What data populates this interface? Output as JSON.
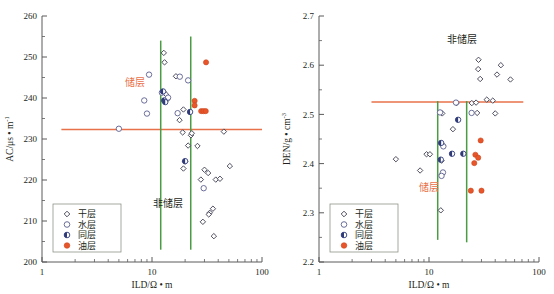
{
  "figure": {
    "panels": [
      "left",
      "right"
    ]
  },
  "chart_data": [
    {
      "panel": "left",
      "type": "scatter",
      "title": "",
      "xlabel": "ILD/Ω • m",
      "ylabel": "AC/μs • m",
      "ylabel_exponent": "-1",
      "xscale": "log",
      "xlim": [
        1,
        100
      ],
      "ylim": [
        200,
        260
      ],
      "xticks": [
        1,
        10,
        100
      ],
      "xticklabels": [
        "1",
        "10",
        "100"
      ],
      "yticks": [
        200,
        210,
        220,
        230,
        240,
        250,
        260
      ],
      "yticklabels": [
        "200",
        "210",
        "220",
        "230",
        "240",
        "250",
        "260"
      ],
      "grid": false,
      "cutoff_lines": {
        "horizontal": {
          "value": 232.3,
          "color": "#e8714a",
          "x_from": 1.5,
          "x_to": 100
        },
        "vertical": [
          {
            "value": 12.0,
            "color": "#4a9c43",
            "y_from": 203.0,
            "y_to": 254.0
          },
          {
            "value": 22.5,
            "color": "#4a9c43",
            "y_from": 203.0,
            "y_to": 255.0
          }
        ]
      },
      "annotations": [
        {
          "text": "储层",
          "x": 7.0,
          "y": 243.0,
          "color": "#e8714a"
        },
        {
          "text": "非储层",
          "x": 14.0,
          "y": 213.5,
          "color": "#231f20"
        }
      ],
      "series": [
        {
          "name": "干层",
          "marker": "diamond",
          "points": [
            [
              12.8,
              251.0
            ],
            [
              13.0,
              248.7
            ],
            [
              16.5,
              245.3
            ],
            [
              13.4,
              240.9
            ],
            [
              13.7,
              239.6
            ],
            [
              19.3,
              237.2
            ],
            [
              17.8,
              234.6
            ],
            [
              19.0,
              231.6
            ],
            [
              22.6,
              230.9
            ],
            [
              25.9,
              228.3
            ],
            [
              21.3,
              228.4
            ],
            [
              20.0,
              224.5
            ],
            [
              19.3,
              222.8
            ],
            [
              30.0,
              222.5
            ],
            [
              32.4,
              221.7
            ],
            [
              27.8,
              220.1
            ],
            [
              38.0,
              220.1
            ],
            [
              41.5,
              220.3
            ],
            [
              51.0,
              223.4
            ],
            [
              35.8,
              213.0
            ],
            [
              33.5,
              212.0
            ],
            [
              32.8,
              211.6
            ],
            [
              29.0,
              209.8
            ],
            [
              36.5,
              206.3
            ],
            [
              45.0,
              231.8
            ],
            [
              23.0,
              231.4
            ]
          ]
        },
        {
          "name": "水层",
          "marker": "circle",
          "points": [
            [
              9.4,
              245.7
            ],
            [
              17.9,
              245.2
            ],
            [
              8.5,
              239.4
            ],
            [
              21.3,
              244.3
            ],
            [
              12.3,
              241.3
            ],
            [
              14.0,
              240.1
            ],
            [
              9.0,
              236.2
            ],
            [
              17.1,
              236.3
            ],
            [
              5.0,
              232.5
            ],
            [
              29.5,
              218.0
            ]
          ]
        },
        {
          "name": "同层",
          "marker": "half-circle",
          "points": [
            [
              12.6,
              241.6
            ],
            [
              12.9,
              239.4
            ],
            [
              13.2,
              239.0
            ],
            [
              22.2,
              236.6
            ],
            [
              20.0,
              224.6
            ]
          ]
        },
        {
          "name": "油层",
          "marker": "filled-circle",
          "points": [
            [
              31.0,
              248.7
            ],
            [
              24.4,
              239.3
            ],
            [
              24.4,
              238.2
            ],
            [
              28.0,
              236.8
            ],
            [
              29.4,
              236.8
            ],
            [
              30.8,
              236.8
            ]
          ]
        }
      ],
      "legend": {
        "position": "lower-left",
        "entries": [
          {
            "label": "干层",
            "marker": "diamond"
          },
          {
            "label": "水层",
            "marker": "circle"
          },
          {
            "label": "同层",
            "marker": "half-circle"
          },
          {
            "label": "油层",
            "marker": "filled-circle"
          }
        ]
      }
    },
    {
      "panel": "right",
      "type": "scatter",
      "title": "",
      "xlabel": "ILD/Ω • m",
      "ylabel": "DEN/g • cm",
      "ylabel_exponent": "-3",
      "xscale": "log",
      "xlim": [
        1,
        100
      ],
      "ylim": [
        2.2,
        2.7
      ],
      "xticks": [
        1,
        10,
        100
      ],
      "xticklabels": [
        "1",
        "10",
        "100"
      ],
      "yticks": [
        2.2,
        2.3,
        2.4,
        2.5,
        2.6,
        2.7
      ],
      "yticklabels": [
        "2.2",
        "2.3",
        "2.4",
        "2.5",
        "2.6",
        "2.7"
      ],
      "grid": false,
      "cutoff_lines": {
        "horizontal": {
          "value": 2.525,
          "color": "#e8714a",
          "x_from": 3.0,
          "x_to": 72.0
        },
        "vertical": [
          {
            "value": 12.0,
            "color": "#4a9c43",
            "y_from": 2.245,
            "y_to": 2.527
          },
          {
            "value": 22.0,
            "color": "#4a9c43",
            "y_from": 2.24,
            "y_to": 2.527
          }
        ]
      },
      "annotations": [
        {
          "text": "非储层",
          "x": 20.0,
          "y": 2.645,
          "color": "#231f20"
        },
        {
          "text": "储层",
          "x": 10.0,
          "y": 2.345,
          "color": "#e8714a"
        }
      ],
      "series": [
        {
          "name": "干层",
          "marker": "diamond",
          "points": [
            [
              28.2,
              2.611
            ],
            [
              28.0,
              2.592
            ],
            [
              29.2,
              2.572
            ],
            [
              41.5,
              2.581
            ],
            [
              45.0,
              2.6
            ],
            [
              55.0,
              2.571
            ],
            [
              33.5,
              2.53
            ],
            [
              38.0,
              2.528
            ],
            [
              24.5,
              2.523
            ],
            [
              26.8,
              2.524
            ],
            [
              17.8,
              2.523
            ],
            [
              13.2,
              2.502
            ],
            [
              27.4,
              2.503
            ],
            [
              40.0,
              2.502
            ],
            [
              16.5,
              2.47
            ],
            [
              5.0,
              2.409
            ],
            [
              8.3,
              2.386
            ],
            [
              9.5,
              2.419
            ],
            [
              10.2,
              2.419
            ],
            [
              13.0,
              2.44
            ],
            [
              13.5,
              2.436
            ],
            [
              13.0,
              2.406
            ],
            [
              13.1,
              2.378
            ],
            [
              12.8,
              2.305
            ]
          ]
        },
        {
          "name": "水层",
          "marker": "circle",
          "points": [
            [
              17.6,
              2.524
            ],
            [
              24.4,
              2.503
            ],
            [
              12.6,
              2.504
            ],
            [
              13.5,
              2.435
            ],
            [
              13.4,
              2.382
            ],
            [
              13.0,
              2.375
            ]
          ]
        },
        {
          "name": "同层",
          "marker": "half-circle",
          "points": [
            [
              18.4,
              2.489
            ],
            [
              12.9,
              2.442
            ],
            [
              16.2,
              2.42
            ],
            [
              20.5,
              2.42
            ],
            [
              12.8,
              2.408
            ]
          ]
        },
        {
          "name": "油层",
          "marker": "filled-circle",
          "points": [
            [
              29.5,
              2.447
            ],
            [
              26.4,
              2.418
            ],
            [
              28.0,
              2.412
            ],
            [
              25.8,
              2.401
            ],
            [
              24.0,
              2.345
            ],
            [
              30.0,
              2.345
            ]
          ]
        }
      ],
      "legend": {
        "position": "lower-left",
        "entries": [
          {
            "label": "干层",
            "marker": "diamond"
          },
          {
            "label": "水层",
            "marker": "circle"
          },
          {
            "label": "同层",
            "marker": "half-circle"
          },
          {
            "label": "油层",
            "marker": "filled-circle"
          }
        ]
      }
    }
  ],
  "colors": {
    "reservoir_cutoff": "#e8714a",
    "zone_divider": "#4a9c43",
    "oil": "#e8552a",
    "mixed": "#2f3a78",
    "water": "#5b5f8e",
    "dry": "#3b3b4f",
    "axis": "#5a5a5a"
  }
}
